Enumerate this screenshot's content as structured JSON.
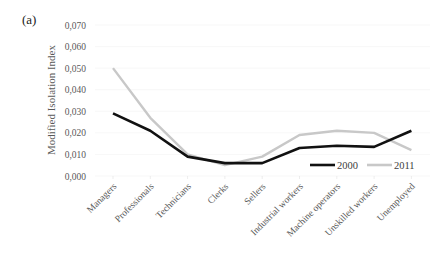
{
  "panel_label": "(a)",
  "chart_data": {
    "type": "line",
    "title": "",
    "xlabel": "",
    "ylabel": "Modified Isolation Index",
    "ylim": [
      0,
      0.07
    ],
    "yticks": [
      "0,000",
      "0,010",
      "0,020",
      "0,030",
      "0,040",
      "0,050",
      "0,060",
      "0,070"
    ],
    "grid": true,
    "legend_position": "lower right (inside plot)",
    "categories": [
      "Managers",
      "Professionals",
      "Technicians",
      "Clerks",
      "Sellers",
      "Industrial workers",
      "Machine operators",
      "Unskilled workers",
      "Unemployed"
    ],
    "series": [
      {
        "name": "2000",
        "color": "#111111",
        "values": [
          0.029,
          0.021,
          0.009,
          0.006,
          0.006,
          0.013,
          0.014,
          0.0135,
          0.021
        ]
      },
      {
        "name": "2011",
        "color": "#c8c8c8",
        "values": [
          0.05,
          0.027,
          0.01,
          0.005,
          0.009,
          0.019,
          0.021,
          0.02,
          0.012
        ]
      }
    ]
  }
}
